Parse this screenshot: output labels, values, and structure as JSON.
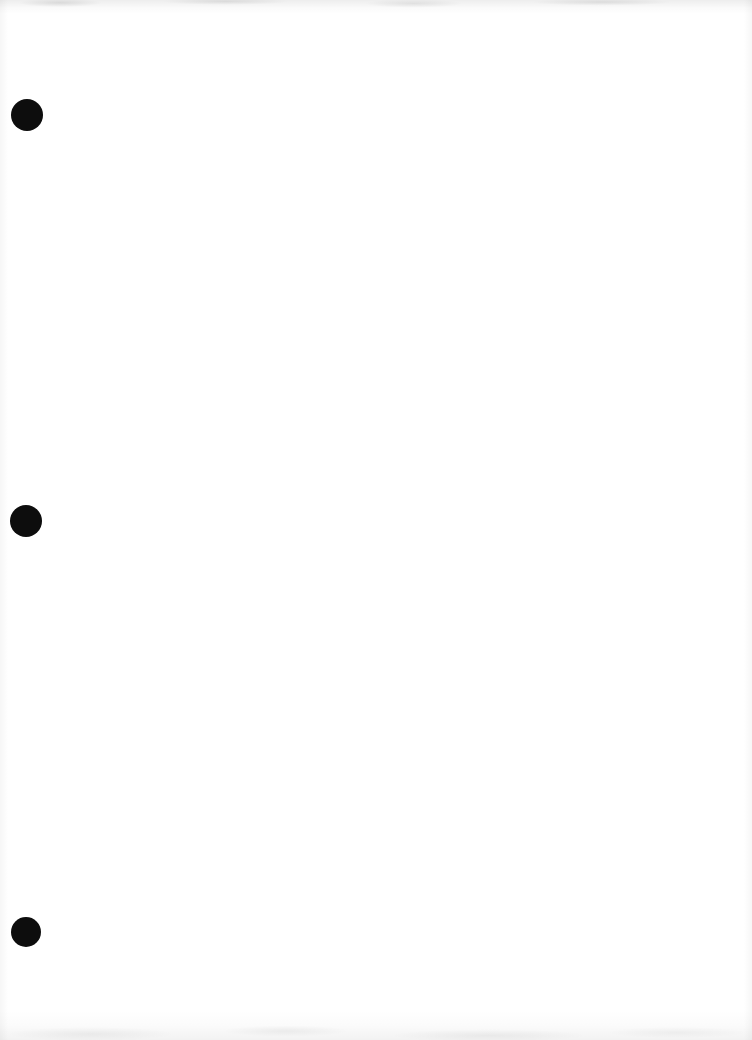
{
  "page": {
    "background_color": "#ffffff"
  },
  "holes": [
    {
      "cx": "27",
      "cy": "115",
      "r": "16",
      "color": "#0d0d0d"
    },
    {
      "cx": "26",
      "cy": "521",
      "r": "16",
      "color": "#0d0d0d"
    },
    {
      "cx": "26",
      "cy": "932",
      "r": "15",
      "color": "#0d0d0d"
    }
  ]
}
